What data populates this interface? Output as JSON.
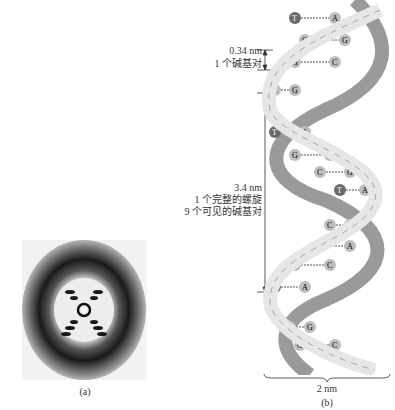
{
  "panel_a": {
    "caption": "(a)",
    "description": "X-ray diffraction photograph of DNA (X pattern)"
  },
  "panel_b": {
    "caption": "(b)",
    "annotations": {
      "base_pair_rise": {
        "value": "0.34 nm",
        "label": "1 个碱基对"
      },
      "helix_turn": {
        "value": "3.4 nm",
        "line1": "1 个完整的螺旋",
        "line2": "9 个可见的碱基对"
      },
      "width": {
        "value": "2 nm"
      }
    },
    "backbone_labels": [
      "S",
      "P"
    ],
    "base_pairs": [
      [
        "T",
        "A"
      ],
      [
        "C",
        "G"
      ],
      [
        "G",
        "C"
      ],
      [
        "C",
        "G"
      ],
      [
        "T",
        "A"
      ],
      [
        "G",
        "C"
      ],
      [
        "C",
        "G"
      ],
      [
        "T",
        "A"
      ],
      [
        "C",
        "G"
      ],
      [
        "T",
        "A"
      ],
      [
        "G",
        "C"
      ],
      [
        "T",
        "A"
      ],
      [
        "C",
        "G"
      ],
      [
        "G",
        "C"
      ]
    ]
  },
  "colors": {
    "strand_light": "#e6e6e6",
    "strand_dark": "#9a9a9a",
    "base_gray": "#bdbdbd",
    "thymine_dark": "#6a6a6a",
    "line": "#333333"
  }
}
